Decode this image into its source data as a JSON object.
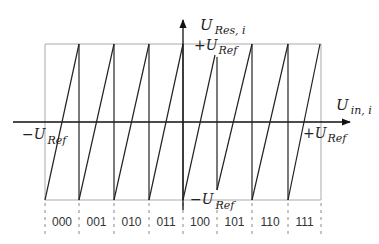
{
  "diagram": {
    "y_axis_label": {
      "main": "U",
      "sub": "Res, i"
    },
    "x_axis_label": {
      "main": "U",
      "sub": "in, i"
    },
    "top_label": {
      "prefix": "+U",
      "sub": "Ref"
    },
    "bottom_label": {
      "prefix": "−U",
      "sub": "Ref"
    },
    "left_label": {
      "prefix": "−U",
      "sub": "Ref"
    },
    "right_label": {
      "prefix": "+U",
      "sub": "Ref"
    },
    "codes": [
      "000",
      "001",
      "010",
      "011",
      "100",
      "101",
      "110",
      "111"
    ],
    "colors": {
      "signal": "#222222",
      "frame": "#aaaaaa",
      "axis": "#111111",
      "dashed": "#888888"
    }
  }
}
